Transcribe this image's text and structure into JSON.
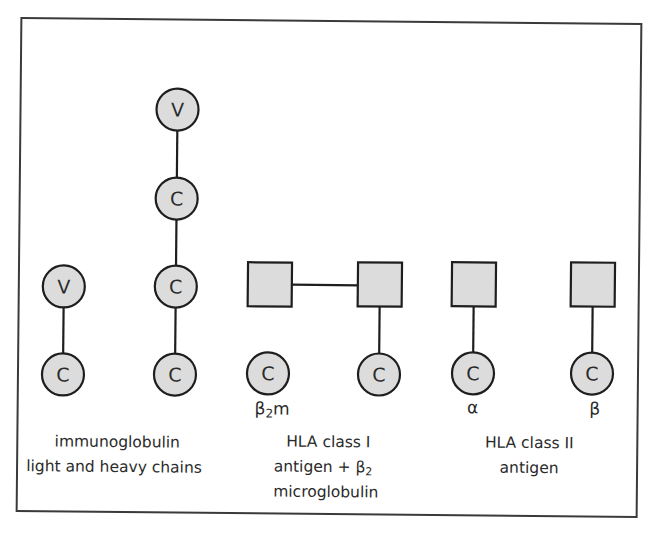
{
  "colors": {
    "domain_fill": "#dcdcdc",
    "stroke": "#1e1e1e",
    "frame": "#3a3a3a",
    "background": "#ffffff"
  },
  "groups": [
    {
      "id": "immunoglobulin",
      "caption": [
        "immunoglobulin",
        "light and heavy chains"
      ],
      "chains": [
        {
          "name": "light-chain",
          "domains": [
            "V",
            "C"
          ]
        },
        {
          "name": "heavy-chain",
          "domains": [
            "V",
            "C",
            "C",
            "C"
          ]
        }
      ]
    },
    {
      "id": "hla-class-i",
      "caption": [
        "HLA class I",
        "antigen + β",
        "microglobulin"
      ],
      "caption_subscript": "2",
      "chains": [
        {
          "name": "beta2-microglobulin",
          "domains": [
            "C"
          ],
          "label": "β",
          "label_subscript": "2",
          "label_suffix": "m"
        },
        {
          "name": "hla-i-heavy-chain",
          "domains": [
            "square",
            "square",
            "C"
          ]
        }
      ]
    },
    {
      "id": "hla-class-ii",
      "caption": [
        "HLA class II",
        "antigen"
      ],
      "chains": [
        {
          "name": "alpha-chain",
          "domains": [
            "square",
            "C"
          ],
          "label": "α"
        },
        {
          "name": "beta-chain",
          "domains": [
            "square",
            "C"
          ],
          "label": "β"
        }
      ]
    }
  ],
  "domain_letters": {
    "variable": "V",
    "constant": "C"
  },
  "labels": {
    "b2m_beta": "β",
    "b2m_sub": "2",
    "b2m_m": "m",
    "alpha": "α",
    "beta": "β",
    "ig_line1": "immunoglobulin",
    "ig_line2": "light and heavy chains",
    "hla1_line1": "HLA class I",
    "hla1_line2": "antigen + β",
    "hla1_line2_sub": "2",
    "hla1_line3": "microglobulin",
    "hla2_line1": "HLA class II",
    "hla2_line2": "antigen"
  }
}
